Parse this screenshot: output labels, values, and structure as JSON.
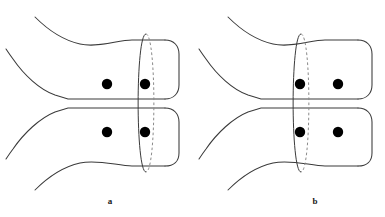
{
  "figure": {
    "background_color": "#ffffff",
    "stroke_color": "#3a3a3a",
    "dot_color": "#000000",
    "dashed_stroke_color": "#8a8a8a",
    "width": 385,
    "height": 217,
    "panels": [
      {
        "id": "panel-a",
        "label": "a",
        "label_x": 110,
        "label_y": 201,
        "origin_x": 0,
        "dots": [
          {
            "cx": 107,
            "cy": 84,
            "r": 5.2,
            "name": "marked-point-upper-left"
          },
          {
            "cx": 145,
            "cy": 84,
            "r": 5.2,
            "name": "marked-point-upper-right"
          },
          {
            "cx": 107,
            "cy": 132,
            "r": 5.2,
            "name": "marked-point-lower-left"
          },
          {
            "cx": 145,
            "cy": 132,
            "r": 5.2,
            "name": "marked-point-lower-right"
          }
        ],
        "ellipse": {
          "cx": 146,
          "cy": 103,
          "rx": 10.5,
          "ry": 69,
          "name": "separating-curve-ellipse",
          "position": "right"
        }
      },
      {
        "id": "panel-b",
        "label": "b",
        "label_x": 315,
        "label_y": 201,
        "origin_x": 193,
        "dots": [
          {
            "cx": 300,
            "cy": 84,
            "r": 5.2,
            "name": "marked-point-upper-left"
          },
          {
            "cx": 338,
            "cy": 84,
            "r": 5.2,
            "name": "marked-point-upper-right"
          },
          {
            "cx": 300,
            "cy": 132,
            "r": 5.2,
            "name": "marked-point-lower-left"
          },
          {
            "cx": 338,
            "cy": 132,
            "r": 5.2,
            "name": "marked-point-lower-right"
          }
        ],
        "ellipse": {
          "cx": 301,
          "cy": 103,
          "rx": 10.5,
          "ry": 69,
          "name": "separating-curve-ellipse",
          "position": "left"
        }
      }
    ],
    "geometry_notes": {
      "tube_upper_top_y": 40,
      "tube_upper_bottom_y": 99,
      "tube_lower_top_y": 108,
      "tube_lower_bottom_y": 166,
      "tube_right_end_x_a": 178,
      "tube_right_end_x_b": 371,
      "cap_radius": 13
    }
  }
}
